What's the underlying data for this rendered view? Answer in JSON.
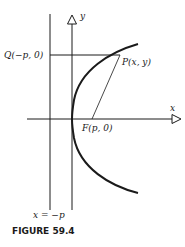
{
  "figure": {
    "caption": "FIGURE 59.4",
    "labels": {
      "y_axis": "y",
      "x_axis": "x",
      "q_point": "Q(−p, 0)",
      "p_point": "P(x, y)",
      "f_point": "F(p, 0)",
      "directrix": "x = −p"
    },
    "colors": {
      "ink": "#1a1a1a",
      "background": "#ffffff"
    }
  }
}
